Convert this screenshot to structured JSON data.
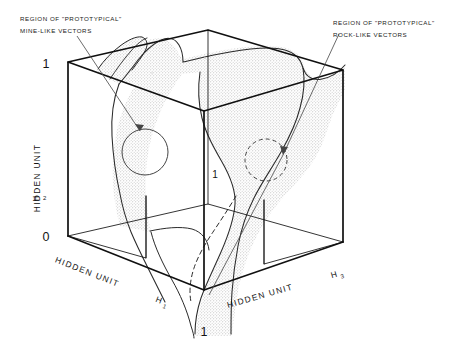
{
  "figure": {
    "kind": "3d-cube-decision-surface-diagram",
    "background_color": "#ffffff",
    "ink_color": "#101010",
    "surface_fill": "#e2e2e2",
    "annotations": {
      "left_callout": {
        "line1": "REGION OF \"PROTOTYPICAL\"",
        "line2": "MINE-LIKE VECTORS"
      },
      "right_callout": {
        "line1": "REGION OF \"PROTOTYPICAL\"",
        "line2": "ROCK-LIKE VECTORS"
      }
    },
    "axes": {
      "vertical": {
        "label_main": "HIDDEN UNIT",
        "label_symbol": "H",
        "label_subscript": "2",
        "tick_max": "1",
        "tick_min": "0"
      },
      "left_depth": {
        "label_main": "HIDDEN UNIT",
        "label_symbol": "H",
        "label_subscript": "1",
        "tick_max": "1"
      },
      "right_depth": {
        "label_main": "HIDDEN UNIT",
        "label_symbol": "H",
        "label_subscript": "3"
      },
      "interior_tick": "1"
    },
    "regions": [
      {
        "name": "mine-like-region",
        "style": "solid-circle"
      },
      {
        "name": "rock-like-region",
        "style": "dashed-circle"
      }
    ]
  }
}
